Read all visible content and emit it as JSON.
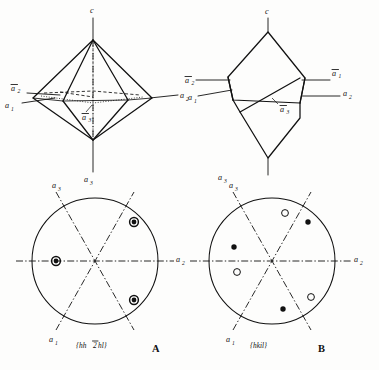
{
  "figure": {
    "background_color": "#fdfdfc",
    "ink_color": "#111111"
  },
  "panels": [
    {
      "id": "crystal-a",
      "kind": "crystal-drawing",
      "position": "top-left",
      "description": "Hexagonal dipyramid with dashed and dotted construction lines",
      "axes": [
        {
          "name": "c-axis",
          "label": "c",
          "overbar": false,
          "subscript": "",
          "placement": "top"
        },
        {
          "name": "a1-axis",
          "label": "a",
          "overbar": false,
          "subscript": "1",
          "placement": "left-lower"
        },
        {
          "name": "a2-bar-axis",
          "label": "a",
          "overbar": true,
          "subscript": "2",
          "placement": "left-upper"
        },
        {
          "name": "a2-axis",
          "label": "a",
          "overbar": false,
          "subscript": "2",
          "placement": "right"
        },
        {
          "name": "a3-bar-axis",
          "label": "a",
          "overbar": true,
          "subscript": "3",
          "placement": "center-lower"
        },
        {
          "name": "a3-axis",
          "label": "a",
          "overbar": false,
          "subscript": "3",
          "placement": "bottom"
        }
      ]
    },
    {
      "id": "crystal-b",
      "kind": "crystal-drawing",
      "position": "top-right",
      "description": "Rhombohedral / scalenohedral form drawn in solid outline",
      "axes": [
        {
          "name": "c-axis",
          "label": "c",
          "overbar": false,
          "subscript": "",
          "placement": "top"
        },
        {
          "name": "a2-bar-axis",
          "label": "a",
          "overbar": true,
          "subscript": "2",
          "placement": "left-upper"
        },
        {
          "name": "a1-axis",
          "label": "a",
          "overbar": false,
          "subscript": "1",
          "placement": "left-lower"
        },
        {
          "name": "a1-bar-axis",
          "label": "a",
          "overbar": true,
          "subscript": "1",
          "placement": "right-upper"
        },
        {
          "name": "a2-axis",
          "label": "a",
          "overbar": false,
          "subscript": "2",
          "placement": "right-lower"
        },
        {
          "name": "a3-bar-axis",
          "label": "a",
          "overbar": true,
          "subscript": "3",
          "placement": "center"
        },
        {
          "name": "a3-axis",
          "label": "a",
          "overbar": false,
          "subscript": "3",
          "placement": "bottom-left"
        }
      ]
    },
    {
      "id": "projection-a",
      "kind": "stereographic-projection",
      "position": "bottom-left",
      "caption": "A",
      "form_symbol": "{hh2hl}",
      "form_symbol_parts": [
        {
          "text": "{",
          "overbar": false
        },
        {
          "text": "h",
          "overbar": false
        },
        {
          "text": "h",
          "overbar": false
        },
        {
          "text": "2",
          "overbar": true
        },
        {
          "text": "h",
          "overbar": false
        },
        {
          "text": "l",
          "overbar": false
        },
        {
          "text": "}",
          "overbar": false
        }
      ],
      "pole_count": 3,
      "pole_style": "filled-with-ring",
      "symmetry": "3-fold",
      "axes": [
        {
          "name": "a3-axis",
          "label": "a",
          "overbar": false,
          "subscript": "3",
          "placement": "top-left"
        },
        {
          "name": "a1-axis",
          "label": "a",
          "overbar": false,
          "subscript": "1",
          "placement": "bottom-left"
        },
        {
          "name": "a2-axis",
          "label": "a",
          "overbar": false,
          "subscript": "2",
          "placement": "right"
        }
      ],
      "poles": [
        {
          "name": "pole-upper-right",
          "angle_deg": 60,
          "radius_fraction": 0.62,
          "type": "filled-ring"
        },
        {
          "name": "pole-left",
          "angle_deg": 180,
          "radius_fraction": 0.62,
          "type": "filled-ring"
        },
        {
          "name": "pole-lower-right",
          "angle_deg": 300,
          "radius_fraction": 0.62,
          "type": "filled-ring"
        }
      ]
    },
    {
      "id": "projection-b",
      "kind": "stereographic-projection",
      "position": "bottom-right",
      "caption": "B",
      "form_symbol": "{hkil}",
      "form_symbol_parts": [
        {
          "text": "{",
          "overbar": false
        },
        {
          "text": "h",
          "overbar": false
        },
        {
          "text": "k",
          "overbar": false
        },
        {
          "text": "i",
          "overbar": false
        },
        {
          "text": "l",
          "overbar": false
        },
        {
          "text": "}",
          "overbar": false
        }
      ],
      "pole_count": 6,
      "pole_style": "alternating-filled-and-open",
      "symmetry": "3-fold with alternating upper and lower poles",
      "axes": [
        {
          "name": "a3-axis",
          "label": "a",
          "overbar": false,
          "subscript": "3",
          "placement": "top-left"
        },
        {
          "name": "a1-axis",
          "label": "a",
          "overbar": false,
          "subscript": "1",
          "placement": "bottom-left"
        },
        {
          "name": "a2-axis",
          "label": "a",
          "overbar": false,
          "subscript": "2",
          "placement": "right"
        }
      ],
      "poles": [
        {
          "name": "pole-1-open",
          "angle_deg": 80,
          "radius_fraction": 0.56,
          "type": "open"
        },
        {
          "name": "pole-2-filled",
          "angle_deg": 48,
          "radius_fraction": 0.62,
          "type": "filled"
        },
        {
          "name": "pole-3-filled",
          "angle_deg": 170,
          "radius_fraction": 0.58,
          "type": "filled"
        },
        {
          "name": "pole-4-open",
          "angle_deg": 203,
          "radius_fraction": 0.58,
          "type": "open"
        },
        {
          "name": "pole-5-open",
          "angle_deg": 318,
          "radius_fraction": 0.6,
          "type": "open"
        },
        {
          "name": "pole-6-filled",
          "angle_deg": 285,
          "radius_fraction": 0.58,
          "type": "filled"
        }
      ]
    }
  ]
}
